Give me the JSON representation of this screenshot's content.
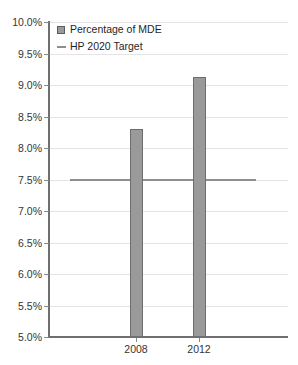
{
  "chart_data": {
    "type": "bar",
    "title": "",
    "xlabel": "",
    "ylabel": "",
    "categories": [
      "2008",
      "2012"
    ],
    "series": [
      {
        "name": "Percentage of MDE",
        "type": "bar",
        "values": [
          8.3,
          9.12
        ]
      },
      {
        "name": "HP 2020 Target",
        "type": "line",
        "value": 7.5,
        "values": [
          7.5,
          7.5
        ]
      }
    ],
    "ylim": [
      5.0,
      10.0
    ],
    "ytick_values": [
      10.0,
      9.5,
      9.0,
      8.5,
      8.0,
      7.5,
      7.0,
      6.5,
      6.0,
      5.5,
      5.0
    ],
    "ytick_labels": [
      "10.0%",
      "9.5%",
      "9.0%",
      "8.5%",
      "8.0%",
      "7.5%",
      "7.0%",
      "6.5%",
      "6.0%",
      "5.5%",
      "5.0%"
    ],
    "grid": true,
    "legend_position": "top-left",
    "colors": {
      "bar_fill": "#9a9a9a",
      "bar_border": "#6d6d6d",
      "target_line": "#8e8e8e",
      "gridline": "#e4e4e4",
      "axis": "#6f6f6f",
      "text": "#343434",
      "background": "#ffffff"
    }
  },
  "legend": {
    "items": [
      {
        "label": "Percentage of MDE",
        "marker": "square-swatch"
      },
      {
        "label": "HP 2020 Target",
        "marker": "line-swatch"
      }
    ]
  },
  "axes": {
    "y": {
      "labels": [
        "10.0%",
        "9.5%",
        "9.0%",
        "8.5%",
        "8.0%",
        "7.5%",
        "7.0%",
        "6.5%",
        "6.0%",
        "5.5%",
        "5.0%"
      ]
    },
    "x": {
      "labels": [
        "2008",
        "2012"
      ]
    }
  }
}
